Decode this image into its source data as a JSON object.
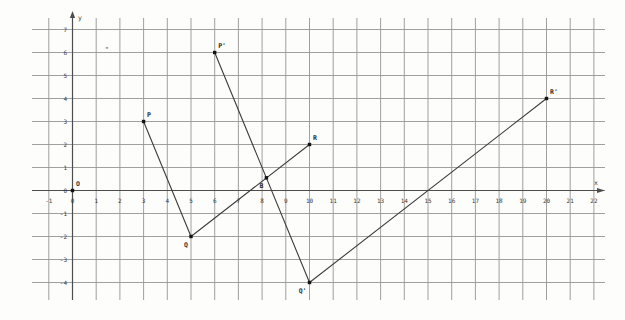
{
  "chart_data": {
    "type": "line",
    "title": "",
    "xlabel": "x",
    "ylabel": "y",
    "origin_label": "O",
    "axes": {
      "x_tick_min": -1,
      "x_tick_max": 22,
      "y_tick_min": -4,
      "y_tick_max": 7,
      "tick_step": 1,
      "grid": true,
      "xlim": [
        -1.7,
        22.5
      ],
      "ylim": [
        -4.8,
        7.5
      ]
    },
    "points": [
      {
        "name": "O",
        "x": 0,
        "y": 0,
        "label_side": "above-right"
      },
      {
        "name": "P",
        "x": 3,
        "y": 3,
        "label_side": "above-right"
      },
      {
        "name": "Q",
        "x": 5,
        "y": -2,
        "label_side": "below-left"
      },
      {
        "name": "R",
        "x": 10,
        "y": 2,
        "label_side": "above-right"
      },
      {
        "name": "P'",
        "x": 6,
        "y": 6,
        "label_side": "above-right"
      },
      {
        "name": "Q'",
        "x": 10,
        "y": -4,
        "label_side": "below-left"
      },
      {
        "name": "R'",
        "x": 20,
        "y": 4,
        "label_side": "above-right"
      },
      {
        "name": "B",
        "x": 8.18,
        "y": 0.55,
        "label_side": "below-left"
      }
    ],
    "segments": [
      {
        "name": "PQ",
        "from": [
          3,
          3
        ],
        "to": [
          5,
          -2
        ]
      },
      {
        "name": "QR",
        "from": [
          5,
          -2
        ],
        "to": [
          10,
          2
        ]
      },
      {
        "name": "P'Q'",
        "from": [
          6,
          6
        ],
        "to": [
          10,
          -4
        ]
      },
      {
        "name": "Q'R'",
        "from": [
          10,
          -4
        ],
        "to": [
          20,
          4
        ]
      }
    ],
    "artifacts": [
      {
        "x": 1.45,
        "y": 6.2
      }
    ]
  },
  "colors": {
    "background": "#fdfdfc",
    "grid_line": "#959595",
    "axis_line": "#4d4d4d",
    "segment_line": "#3c3c3c",
    "point_fill": "#141414",
    "tick_text": "#3a3a3a",
    "label_text": "#2c2c2c",
    "artifact": "#8a8a8a"
  }
}
